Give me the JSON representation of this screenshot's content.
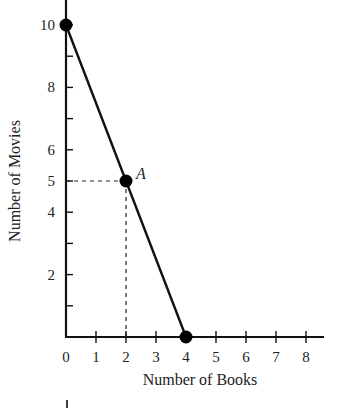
{
  "chart_data": {
    "type": "line",
    "title": "",
    "xlabel": "Number of Books",
    "ylabel": "Number of Movies",
    "xlim": [
      0,
      8
    ],
    "ylim": [
      0,
      10
    ],
    "x_ticks": [
      0,
      1,
      2,
      3,
      4,
      5,
      6,
      7,
      8
    ],
    "y_tick_labels": [
      2,
      4,
      5,
      6,
      8,
      10
    ],
    "y_ticks": [
      1,
      2,
      3,
      4,
      5,
      6,
      7,
      8,
      9,
      10
    ],
    "grid": false,
    "series": [
      {
        "name": "Production possibilities",
        "x": [
          0,
          2,
          4
        ],
        "y": [
          10,
          5,
          0
        ]
      }
    ],
    "points": [
      {
        "x": 0,
        "y": 10,
        "label": ""
      },
      {
        "x": 2,
        "y": 5,
        "label": "A"
      },
      {
        "x": 4,
        "y": 0,
        "label": ""
      }
    ],
    "annotations": [
      {
        "type": "dashed-guide",
        "from": [
          0,
          5
        ],
        "to": [
          2,
          5
        ]
      },
      {
        "type": "dashed-guide",
        "from": [
          2,
          0
        ],
        "to": [
          2,
          5
        ]
      },
      {
        "text": "A",
        "at": [
          2,
          5
        ]
      }
    ]
  }
}
